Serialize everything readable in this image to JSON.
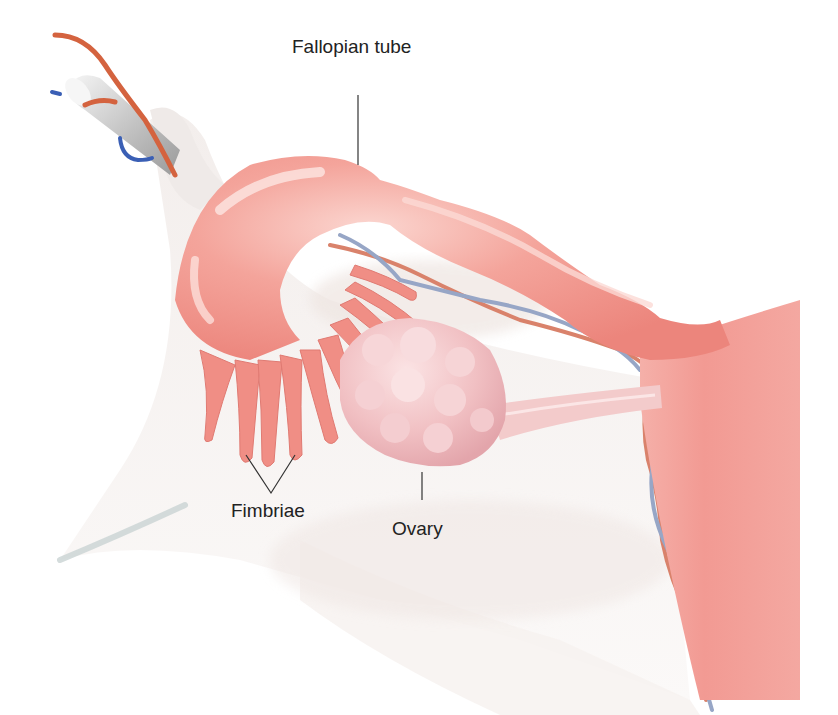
{
  "figure": {
    "labels": {
      "fallopian_tube": "Fallopian tube",
      "fimbriae": "Fimbriae",
      "ovary": "Ovary"
    },
    "colors": {
      "tissue_pink": "#f29a93",
      "tissue_light": "#f7c3bd",
      "ovary": "#f2c4c6",
      "ligament_bg": "#ece6e3",
      "artery": "#d86a4c",
      "vein": "#8fa0c2",
      "vessel_blue": "#3a5fb5",
      "ligament_stump": "#b8b8b8",
      "leader_line": "#333333"
    }
  }
}
